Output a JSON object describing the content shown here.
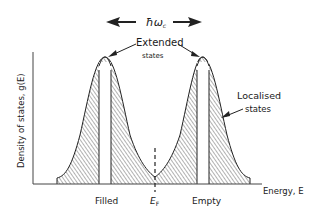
{
  "figure": {
    "type": "density-of-states-diagram",
    "labels": {
      "spacing": "ħω",
      "spacing_sub": "c",
      "extended_line1": "Extended",
      "extended_line2": "states",
      "localised_line1": "Localised",
      "localised_line2": "states",
      "y_axis": "Density of states, g(E)",
      "x_axis": "Energy, E",
      "filled": "Filled",
      "fermi": "E",
      "fermi_sub": "F",
      "empty": "Empty"
    },
    "colors": {
      "line": "#222222",
      "hatch": "#555555",
      "background": "#ffffff"
    }
  }
}
